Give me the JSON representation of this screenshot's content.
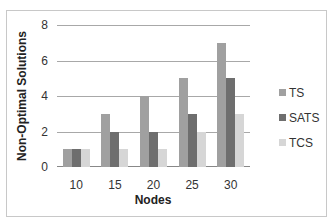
{
  "chart_data": {
    "type": "bar",
    "title": "",
    "xlabel": "Nodes",
    "ylabel": "Non-Optimal Solutions",
    "categories": [
      "10",
      "15",
      "20",
      "25",
      "30"
    ],
    "series": [
      {
        "name": "TS",
        "values": [
          1,
          3,
          4,
          5,
          7
        ],
        "color": "#a0a0a0"
      },
      {
        "name": "SATS",
        "values": [
          1,
          2,
          2,
          3,
          5
        ],
        "color": "#6e6e6e"
      },
      {
        "name": "TCS",
        "values": [
          1,
          1,
          1,
          2,
          3
        ],
        "color": "#d6d6d6"
      }
    ],
    "ylim": [
      0,
      8
    ],
    "yticks": [
      "0",
      "2",
      "4",
      "6",
      "8"
    ],
    "grid": true,
    "legend_position": "right"
  }
}
